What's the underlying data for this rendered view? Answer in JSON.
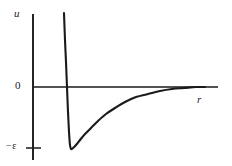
{
  "figure": {
    "kind": "line-plot",
    "background_color": "#ffffff",
    "ink_color": "#1a1a1a",
    "width": 232,
    "height": 166
  },
  "labels": {
    "y_axis": "u",
    "x_axis": "r",
    "zero_tick": "0",
    "well_depth_tick": "−ε"
  },
  "chart_data": {
    "type": "line",
    "title": "",
    "subtitle": "",
    "xlabel": "r",
    "ylabel": "u",
    "grid": false,
    "legend": null,
    "annotations": [
      {
        "text": "0",
        "axis": "y",
        "value": 0
      },
      {
        "text": "−ε",
        "axis": "y",
        "value": -1
      }
    ],
    "xlim": [
      0,
      3.6
    ],
    "ylim": [
      -1.35,
      2.2
    ],
    "axis_origin_px": {
      "x": 33,
      "y": 87
    },
    "x_axis_end_px": 218,
    "y_axis_top_px": 14,
    "y_axis_bottom_px": 160,
    "tick_marks": [
      {
        "label": "−ε",
        "y_px": 148,
        "x_from_px": 26,
        "x_to_px": 41
      }
    ],
    "series": [
      {
        "name": "Lennard-Jones 6-12 potential",
        "description": "Steep repulsive wall, minimum at -ε, asymptotic approach to zero",
        "minimum_px": {
          "x": 70,
          "y": 148
        },
        "zero_crossing_px": {
          "x": 67,
          "y": 87
        },
        "wall_top_px": {
          "x": 64,
          "y": 13
        },
        "points_px": [
          [
            64,
            13
          ],
          [
            65,
            40
          ],
          [
            66,
            62
          ],
          [
            67,
            87
          ],
          [
            68,
            112
          ],
          [
            69,
            132
          ],
          [
            70,
            145
          ],
          [
            71,
            149
          ],
          [
            73,
            148
          ],
          [
            76,
            145
          ],
          [
            80,
            140
          ],
          [
            85,
            134
          ],
          [
            91,
            128
          ],
          [
            98,
            121
          ],
          [
            106,
            114
          ],
          [
            115,
            108
          ],
          [
            125,
            102
          ],
          [
            136,
            97
          ],
          [
            148,
            94
          ],
          [
            160,
            91
          ],
          [
            172,
            89
          ],
          [
            184,
            88
          ],
          [
            196,
            87
          ],
          [
            205,
            87
          ]
        ]
      }
    ]
  }
}
